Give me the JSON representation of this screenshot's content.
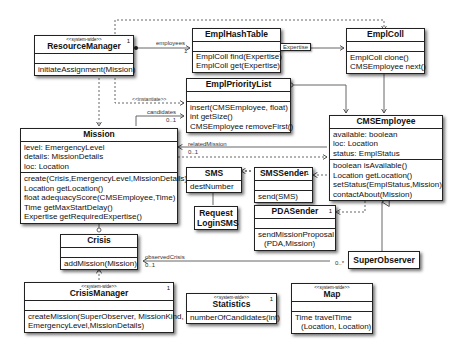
{
  "classes": {
    "resource_manager": {
      "stereotype": "<<system-wide>>",
      "name": "ResourceManager",
      "multiplicity": "1",
      "operations": [
        "initiateAssignment(Mission)"
      ]
    },
    "empl_hash_table": {
      "name": "EmplHashTable",
      "operations": [
        "EmplColl find(Expertise)",
        "EmplColl get(Expertise)"
      ]
    },
    "empl_coll": {
      "name": "EmplColl",
      "operations": [
        "EmplColl clone()",
        "CMSEmployee next()"
      ]
    },
    "empl_priority_list": {
      "name": "EmplPriorityList",
      "operations": [
        "insert(CMSEmployee, float)",
        "int getSize()",
        "CMSEmployee removeFirst()"
      ]
    },
    "mission": {
      "name": "Mission",
      "attributes": [
        "level: EmergencyLevel",
        "details: MissionDetails",
        "loc: Location"
      ],
      "operations": [
        "create(Crisis,EmergencyLevel,MissionDetails)",
        "Location getLocation()",
        "float adequacyScore(CMSEmployee,Time)",
        "Time getMaxStartDelay()",
        "Expertise getRequiredExpertise()"
      ]
    },
    "cms_employee": {
      "name": "CMSEmployee",
      "attributes": [
        "available: boolean",
        "loc: Location",
        "status: EmplStatus"
      ],
      "operations": [
        "boolean isAvailable()",
        "Location getLocation()",
        "setStatus(EmplStatus,Mission)",
        "contactAbout(Mission)"
      ]
    },
    "sms": {
      "name": "SMS",
      "attributes": [
        "destNumber"
      ]
    },
    "sms_sender": {
      "name": "SMSSender",
      "multiplicity": "1",
      "operations": [
        "send(SMS)"
      ]
    },
    "request_login_sms": {
      "name_line1": "Request",
      "name_line2": "LoginSMS"
    },
    "pda_sender": {
      "name": "PDASender",
      "multiplicity": "1",
      "operations": [
        "sendMissionProposal",
        "(PDA,Mission)"
      ]
    },
    "crisis": {
      "name": "Crisis",
      "operations": [
        "addMission(Mission)"
      ]
    },
    "super_observer": {
      "name": "SuperObserver"
    },
    "crisis_manager": {
      "stereotype": "<<system-wide>>",
      "name": "CrisisManager",
      "multiplicity": "1",
      "operations": [
        "createMission(SuperObserver, MissionKind,",
        "EmergencyLevel,MissionDetails)"
      ]
    },
    "statistics": {
      "stereotype": "<<system-wide>>",
      "name": "Statistics",
      "multiplicity": "1",
      "operations": [
        "numberOfCandidates(int)"
      ]
    },
    "map": {
      "stereotype": "<<system-wide>>",
      "name": "Map",
      "operations": [
        "Time travelTime",
        "(Location, Location)"
      ]
    }
  },
  "associations": {
    "employees": {
      "role": "employees",
      "mult": "1"
    },
    "expertise_qualifier": "Expertise",
    "instantiate": "<<instantiate>>",
    "candidates": {
      "role": "candidates",
      "mult": "0..1"
    },
    "related_mission": {
      "role": "relatedMission",
      "mult": "0..1"
    },
    "observed_crisis": {
      "role": "observedCrisis",
      "mult": "0..1"
    },
    "super_observer_mult": "0..*",
    "mission_crisis_mult": "0..*",
    "empl_coll_mult": "0..*",
    "priority_mult": "0..*"
  }
}
